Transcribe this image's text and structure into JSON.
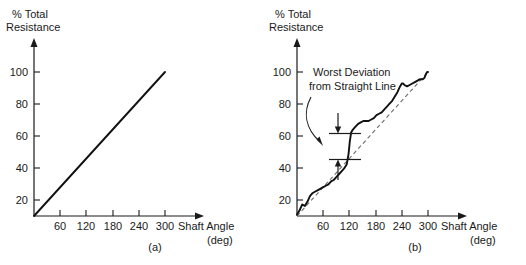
{
  "figure": {
    "background_color": "#ffffff",
    "ink_color": "#1a1a1a",
    "ideal_line_color": "#6b6b6b"
  },
  "chart_data": [
    {
      "id": "panel-a",
      "type": "line",
      "title": "",
      "caption": "(a)",
      "ylabel_line1": "% Total",
      "ylabel_line2": "Resistance",
      "xlabel_line1": "Shaft Angle",
      "xlabel_line2": "(deg)",
      "xlim": [
        0,
        330
      ],
      "ylim": [
        0,
        112
      ],
      "xticks": [
        60,
        120,
        180,
        240,
        300
      ],
      "xtick_labels": [
        "60",
        "120",
        "180",
        "240",
        "300"
      ],
      "yticks": [
        20,
        40,
        60,
        80,
        100
      ],
      "ytick_labels": [
        "20",
        "40",
        "60",
        "80",
        "100"
      ],
      "grid": false,
      "legend": "none",
      "series": [
        {
          "name": "Ideal linear resistance",
          "style": "solid",
          "x": [
            0,
            300
          ],
          "values": [
            0,
            100
          ]
        }
      ]
    },
    {
      "id": "panel-b",
      "type": "line",
      "title": "",
      "caption": "(b)",
      "ylabel_line1": "% Total",
      "ylabel_line2": "Resistance",
      "xlabel_line1": "Shaft Angle",
      "xlabel_line2": "(deg)",
      "xlim": [
        0,
        330
      ],
      "ylim": [
        0,
        112
      ],
      "xticks": [
        60,
        120,
        180,
        240,
        300
      ],
      "xtick_labels": [
        "60",
        "120",
        "180",
        "240",
        "300"
      ],
      "yticks": [
        20,
        40,
        60,
        80,
        100
      ],
      "ytick_labels": [
        "20",
        "40",
        "60",
        "80",
        "100"
      ],
      "grid": false,
      "legend": "none",
      "annotation_label_line1": "Worst Deviation",
      "annotation_label_line2": "from Straight Line",
      "annotation_upper_level": 62,
      "annotation_lower_level": 46,
      "series": [
        {
          "name": "Ideal straight line",
          "style": "dashed",
          "x": [
            0,
            300
          ],
          "values": [
            0,
            100
          ]
        },
        {
          "name": "Actual resistance",
          "style": "solid",
          "x": [
            0,
            6,
            12,
            18,
            24,
            30,
            36,
            42,
            48,
            54,
            60,
            66,
            72,
            78,
            84,
            90,
            96,
            102,
            108,
            114,
            118,
            121,
            124,
            128,
            134,
            140,
            146,
            152,
            158,
            164,
            170,
            176,
            182,
            188,
            194,
            200,
            206,
            212,
            218,
            224,
            230,
            236,
            240,
            243,
            246,
            252,
            258,
            264,
            270,
            276,
            282,
            288,
            292,
            296,
            298,
            300
          ],
          "values": [
            1,
            4,
            8,
            7,
            10,
            14,
            16,
            17,
            18,
            19,
            20,
            21,
            22,
            24,
            25,
            27,
            29,
            31,
            33,
            36,
            43,
            52,
            58,
            60,
            62,
            64,
            65,
            66,
            66,
            66,
            67,
            68,
            70,
            71,
            72,
            74,
            76,
            78,
            80,
            83,
            86,
            90,
            92,
            92,
            91,
            90,
            91,
            92,
            93,
            94,
            95,
            95,
            96,
            99,
            100,
            100
          ]
        }
      ]
    }
  ]
}
